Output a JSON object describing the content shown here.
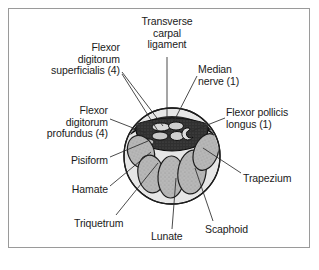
{
  "figure": {
    "type": "anatomical-cross-section",
    "border_color": "#9a9a9a",
    "background_color": "#ffffff",
    "text_color": "#1a1a1a",
    "leader_line_color": "#2b2b2b",
    "bone_fill_color": "#b3b3b3",
    "tendon_fill_color": "#2e2e2e",
    "section_fill_color": "#e8e8e8"
  },
  "labels": [
    {
      "id": "transverse-carpal-ligament",
      "text": "Transverse\ncarpal\nligament",
      "align": "center",
      "x": 131,
      "y": 16,
      "width": 72
    },
    {
      "id": "flexor-digitorum-superficialis",
      "text": "Flexor\ndigitorum\nsuperficialis (4)",
      "align": "right",
      "x": 36,
      "y": 42,
      "width": 84
    },
    {
      "id": "median-nerve",
      "text": "Median\nnerve (1)",
      "align": "left",
      "x": 198,
      "y": 64,
      "width": 70
    },
    {
      "id": "flexor-digitorum-profundus",
      "text": "Flexor\ndigitorum\nprofundus (4)",
      "align": "right",
      "x": 26,
      "y": 105,
      "width": 82
    },
    {
      "id": "flexor-pollicis-longus",
      "text": "Flexor pollicis\nlongus (1)",
      "align": "left",
      "x": 226,
      "y": 107,
      "width": 82
    },
    {
      "id": "pisiform",
      "text": "Pisiform",
      "align": "right",
      "x": 44,
      "y": 155,
      "width": 64
    },
    {
      "id": "trapezium",
      "text": "Trapezium",
      "align": "left",
      "x": 243,
      "y": 173,
      "width": 66
    },
    {
      "id": "hamate",
      "text": "Hamate",
      "align": "right",
      "x": 48,
      "y": 184,
      "width": 60
    },
    {
      "id": "triquetrum",
      "text": "Triquetrum",
      "align": "left",
      "x": 74,
      "y": 218,
      "width": 70
    },
    {
      "id": "lunate",
      "text": "Lunate",
      "align": "left",
      "x": 151,
      "y": 231,
      "width": 50
    },
    {
      "id": "scaphoid",
      "text": "Scaphoid",
      "align": "left",
      "x": 205,
      "y": 224,
      "width": 62
    }
  ],
  "leader_lines": [
    {
      "id": "leader-transverse-carpal-ligament",
      "points": "167,57 167,122"
    },
    {
      "id": "leader-flexor-digitorum-superficialis-a",
      "points": "122,72 163,126"
    },
    {
      "id": "leader-flexor-digitorum-superficialis-b",
      "points": "122,74 158,131"
    },
    {
      "id": "leader-median-nerve",
      "points": "197,76 174,121"
    },
    {
      "id": "leader-flexor-digitorum-profundus",
      "points": "110,119 146,133"
    },
    {
      "id": "leader-flexor-pollicis-longus",
      "points": "225,118 192,131"
    },
    {
      "id": "leader-pisiform",
      "points": "110,157 148,141"
    },
    {
      "id": "leader-trapezium",
      "points": "241,173 203,148"
    },
    {
      "id": "leader-hamate",
      "points": "110,186 151,152"
    },
    {
      "id": "leader-triquetrum",
      "points": "116,215 158,163"
    },
    {
      "id": "leader-lunate",
      "points": "172,229 176,178"
    },
    {
      "id": "leader-scaphoid",
      "points": "213,221 195,168"
    }
  ],
  "illustration": {
    "section_circle": {
      "cx": 172,
      "cy": 156,
      "r": 48
    },
    "bones": [
      {
        "id": "bone-pisiform",
        "cx": 141,
        "cy": 152,
        "rx": 13,
        "ry": 17,
        "rot": -22
      },
      {
        "id": "bone-hamate",
        "cx": 151,
        "cy": 174,
        "rx": 13,
        "ry": 19,
        "rot": -10
      },
      {
        "id": "bone-triquetrum",
        "cx": 171,
        "cy": 177,
        "rx": 13,
        "ry": 21,
        "rot": 2
      },
      {
        "id": "bone-lunate",
        "cx": 192,
        "cy": 172,
        "rx": 14,
        "ry": 22,
        "rot": 8
      },
      {
        "id": "bone-scaphoid",
        "cx": 206,
        "cy": 152,
        "rx": 12,
        "ry": 19,
        "rot": 20
      }
    ],
    "tendons": [
      {
        "id": "tendon-ring-1",
        "cx": 161,
        "cy": 127,
        "rx": 9,
        "ry": 4
      },
      {
        "id": "tendon-ring-2",
        "cx": 176,
        "cy": 126,
        "rx": 7.5,
        "ry": 4
      },
      {
        "id": "tendon-ring-3",
        "cx": 160,
        "cy": 136,
        "rx": 8,
        "ry": 4
      },
      {
        "id": "tendon-ring-4",
        "cx": 177,
        "cy": 136,
        "rx": 7,
        "ry": 4.5
      }
    ]
  }
}
